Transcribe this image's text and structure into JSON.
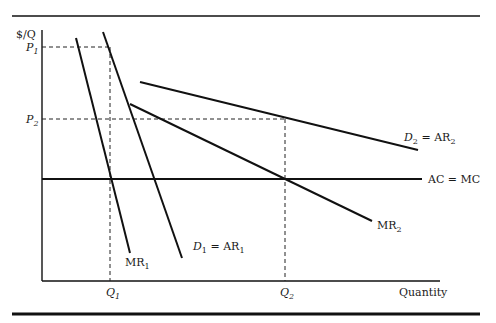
{
  "diagram": {
    "type": "economics-price-discrimination",
    "y_axis_label": "$/Q",
    "x_axis_label": "Quantity",
    "price_ticks": [
      {
        "base": "P",
        "sub": "1"
      },
      {
        "base": "P",
        "sub": "2"
      }
    ],
    "quantity_ticks": [
      {
        "base": "Q",
        "sub": "1"
      },
      {
        "base": "Q",
        "sub": "2"
      }
    ],
    "curves": {
      "mr1": {
        "base": "MR",
        "sub": "1"
      },
      "d1": {
        "lhs_base": "D",
        "lhs_sub": "1",
        "eq": " = ",
        "rhs_base": "AR",
        "rhs_sub": "1"
      },
      "d2": {
        "lhs_base": "D",
        "lhs_sub": "2",
        "eq": " = ",
        "rhs_base": "AR",
        "rhs_sub": "2"
      },
      "mr2": {
        "base": "MR",
        "sub": "2"
      },
      "acmc": "AC = MC"
    },
    "colors": {
      "line": "#111111",
      "background": "#ffffff"
    }
  }
}
